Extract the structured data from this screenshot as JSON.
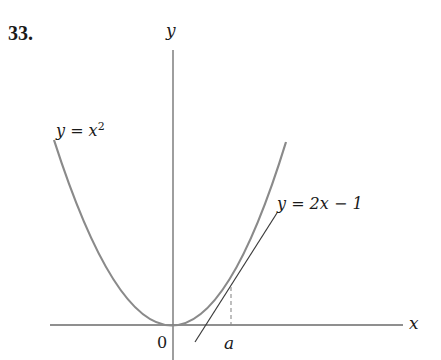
{
  "problem_number": "33.",
  "axes": {
    "x_label": "x",
    "y_label": "y",
    "origin_label": "0",
    "point_label": "a"
  },
  "curves": {
    "parabola_label_prefix": "y = x",
    "parabola_label_exponent": "2",
    "tangent_label": "y = 2x − 1"
  },
  "colors": {
    "curve": "#8a8a8a",
    "axis": "#6a6a6a",
    "tangent": "#3a3a3a",
    "text": "#1a1a1a"
  }
}
